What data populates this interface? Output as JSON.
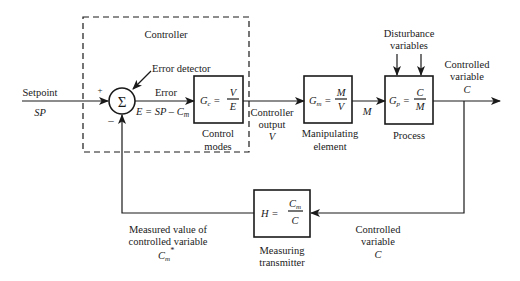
{
  "diagram": {
    "type": "feedback-control-block-diagram",
    "controller_group": {
      "label": "Controller"
    },
    "input": {
      "label": "Setpoint",
      "symbol": "SP",
      "plus_sign": "+"
    },
    "summing_junction": {
      "symbol": "Σ",
      "label": "Error detector",
      "minus_sign": "–"
    },
    "error_signal": {
      "label": "Error",
      "equation_lhs": "E = SP – C",
      "equation_sub": "m"
    },
    "blocks": [
      {
        "id": "controller",
        "gain_sym": "G",
        "gain_sub": "c",
        "num": "V",
        "den": "E",
        "caption_line1": "Control",
        "caption_line2": "modes"
      },
      {
        "id": "manipulating",
        "gain_sym": "G",
        "gain_sub": "m",
        "num": "M",
        "den": "V",
        "caption_line1": "Manipulating",
        "caption_line2": "element"
      },
      {
        "id": "process",
        "gain_sym": "G",
        "gain_sub": "p",
        "num": "C",
        "den": "M",
        "caption_line1": "Process",
        "caption_line2": ""
      },
      {
        "id": "measuring",
        "gain_sym": "H",
        "gain_sub": "",
        "num_sym": "C",
        "num_sub": "m",
        "den": "C",
        "caption_line1": "Measuring",
        "caption_line2": "transmitter"
      }
    ],
    "controller_output": {
      "line1": "Controller",
      "line2": "output",
      "symbol": "V"
    },
    "manipulated_variable": {
      "symbol": "M"
    },
    "disturbance": {
      "line1": "Disturbance",
      "line2": "variables"
    },
    "output": {
      "line1": "Controlled",
      "line2": "variable",
      "symbol": "C"
    },
    "feedback_input": {
      "line1": "Controlled",
      "line2": "variable",
      "symbol": "C"
    },
    "measured_value": {
      "line1": "Measured value of",
      "line2": "controlled variable",
      "symbol": "C",
      "sub": "m",
      "sup": "*"
    }
  }
}
